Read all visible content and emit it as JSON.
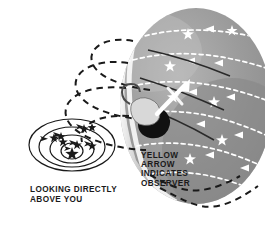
{
  "figure": {
    "background_color": "#ffffff"
  },
  "captions": {
    "observer_note": "YELLOW\nARROW\nINDICATES\nOBSERVER",
    "zenith_note": "LOOKING DIRECTLY\nABOVE YOU"
  },
  "colors": {
    "dome_fill": "#9a9a9a",
    "dome_shadow": "#7e7e7e",
    "dome_highlight": "#f2f2f2",
    "star_path_light": "#ffffff",
    "star_path_dark": "#1a1a1a",
    "observer_silhouette": "#111111",
    "arrow_observer": "#ffffff",
    "text": "#1a1a1a"
  },
  "sky_dome": {
    "name": "sky-dome",
    "center_x": 196,
    "center_y": 106,
    "radius_x": 76,
    "radius_y": 98,
    "star_arc_count": 5,
    "arrow_direction": "leftward"
  },
  "observer": {
    "name": "observer-figure",
    "x": 141,
    "y": 119,
    "arrow_label": "yellow-arrow",
    "arrow_points_to": "zenith"
  },
  "circumpolar_inset": {
    "name": "circumpolar-star-trails",
    "center_x": 72,
    "center_y": 151,
    "ring_count": 4,
    "rings": [
      {
        "rx": 11,
        "ry": 8
      },
      {
        "rx": 22,
        "ry": 14
      },
      {
        "rx": 33,
        "ry": 20
      },
      {
        "rx": 43,
        "ry": 26
      }
    ],
    "center_star": true,
    "star_count": 8,
    "arrow_count": 6,
    "rotation_direction": "counterclockwise"
  },
  "dashed_paths": {
    "name": "star-path-continuations",
    "count": 5,
    "style": "dashed",
    "color": "#1a1a1a"
  }
}
